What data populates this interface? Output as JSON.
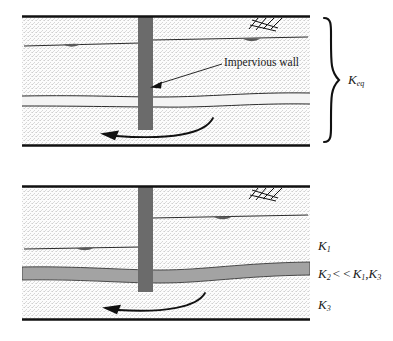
{
  "figure": {
    "panels": [
      {
        "id": "top",
        "name": "equivalent-homogeneous-profile",
        "annotation": "Impervious wall",
        "labels": [
          {
            "name": "k-eq",
            "base": "K",
            "sub": "eq"
          }
        ],
        "features": {
          "wall": "impervious-wall",
          "flow": "seepage-flow-arrow",
          "brace": "equivalent-conductivity-brace",
          "ground_symbol": "hatched-ground-symbol",
          "water_table": "stepped-water-table"
        }
      },
      {
        "id": "bottom",
        "name": "layered-profile",
        "labels": [
          {
            "name": "k1",
            "base": "K",
            "sub": "1",
            "text": "K1"
          },
          {
            "name": "k2-inequality",
            "base": "K",
            "sub": "2",
            "relation": "< <",
            "compare_a": "K1",
            "compare_b": "K3",
            "text": "K2 < < K1,K3"
          },
          {
            "name": "k3",
            "base": "K",
            "sub": "3",
            "text": "K3"
          }
        ],
        "features": {
          "wall": "impervious-wall",
          "flow": "seepage-flow-arrow",
          "aquitard": "low-conductivity-layer",
          "ground_symbol": "hatched-ground-symbol",
          "water_table": "stepped-water-table"
        }
      }
    ]
  },
  "colors": {
    "wall": "#6b6b6b",
    "aquitard": "#a0a0a0",
    "soil_fill": "#fbfbfb",
    "line": "#1a1a1a",
    "stipple": "#c9c9c9"
  }
}
